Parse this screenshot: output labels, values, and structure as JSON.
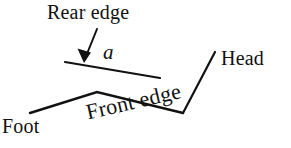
{
  "figure": {
    "background_color": "#ffffff",
    "stroke_color": "#111111",
    "width": 291,
    "height": 148,
    "labels": {
      "rear_edge": "Rear edge",
      "angle": "a",
      "head": "Head",
      "foot": "Foot",
      "front_edge": "Front edge"
    },
    "geometry": {
      "rear_edge_line": "M65,62 L160,78",
      "arrow_shaft": "M97,29 L84,61",
      "arrow_head": "84,62 78,50 90,52",
      "head_leader_line": "M215,52 L183,113",
      "front_edge_polyline": "M30,113 L97,92 L183,113"
    }
  }
}
